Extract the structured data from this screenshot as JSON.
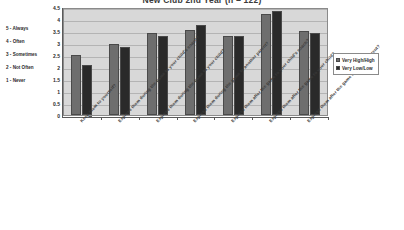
{
  "chart_data": {
    "type": "bar",
    "title": "New Club 2nd Year (n = 122)",
    "xlabel": "",
    "ylabel": "",
    "ylim": [
      0,
      4.5
    ],
    "ytick_labels": [
      "0",
      "0.5",
      "1",
      "1.5",
      "2",
      "2.5",
      "3",
      "3.5",
      "4",
      "4.5"
    ],
    "ytick_values": [
      0,
      0.5,
      1,
      1.5,
      2,
      2.5,
      3,
      3.5,
      4,
      4.5
    ],
    "grid": true,
    "legend_position": "right",
    "categories": [
      "Keep them to yourself?",
      "Express them during the game to your child's coach?",
      "Express them during the game to your child?",
      "Express them during the game to another parent?",
      "Express them after the game to your child's coach?",
      "Express them after the game to your child?",
      "Express them after the game to another parent?"
    ],
    "series": [
      {
        "name": "Very High/High",
        "values": [
          2.5,
          2.95,
          3.4,
          3.55,
          3.3,
          4.2,
          3.5
        ],
        "color": "#6e6e6e"
      },
      {
        "name": "Very Low/Low",
        "values": [
          2.1,
          2.85,
          3.3,
          3.75,
          3.3,
          4.35,
          3.4
        ],
        "color": "#2a2a2a"
      }
    ]
  },
  "scale_key": {
    "items": [
      "5 - Always",
      "4 - Often",
      "3 - Sometimes",
      "2 - Not Often",
      "1 - Never"
    ]
  },
  "legend": {
    "series_1_label": "Very High/High",
    "series_2_label": "Very Low/Low"
  },
  "colors": {
    "series_1": "#6e6e6e",
    "series_2": "#2a2a2a",
    "plot_background": "#d8d8d8",
    "gridline": "#b4b4b4",
    "axis": "#5a5a5a"
  }
}
